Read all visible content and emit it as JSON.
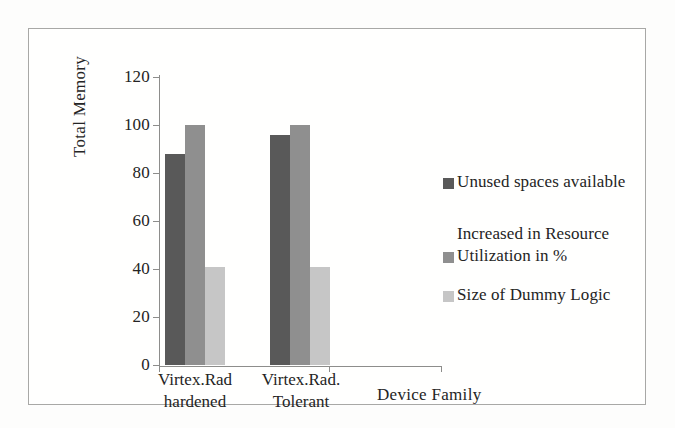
{
  "chart_data": {
    "type": "bar",
    "title": "",
    "xlabel": "Device Family",
    "ylabel": "Total Memory",
    "categories": [
      "Virtex.Rad hardened",
      "Virtex.Rad. Tolerant"
    ],
    "category_lines": [
      [
        "Virtex.Rad",
        "hardened"
      ],
      [
        "Virtex.Rad.",
        "Tolerant"
      ]
    ],
    "series": [
      {
        "name": "Unused spaces available",
        "values": [
          88,
          96
        ],
        "color": "#595959"
      },
      {
        "name": "Increased in Resource Utilization in %",
        "values": [
          100,
          100
        ],
        "color": "#8f8f8f"
      },
      {
        "name": "Size of Dummy Logic",
        "values": [
          41,
          41
        ],
        "color": "#c6c6c6"
      }
    ],
    "legend_labels": [
      "Unused spaces available",
      "Increased in Resource\nUtilization in %",
      "Size of Dummy Logic"
    ],
    "ylim": [
      0,
      120
    ],
    "yticks": [
      0,
      20,
      40,
      60,
      80,
      100,
      120
    ],
    "ytick_labels": [
      "0",
      "20",
      "40",
      "60",
      "80",
      "100",
      "120"
    ],
    "grid": false,
    "legend_position": "right"
  }
}
